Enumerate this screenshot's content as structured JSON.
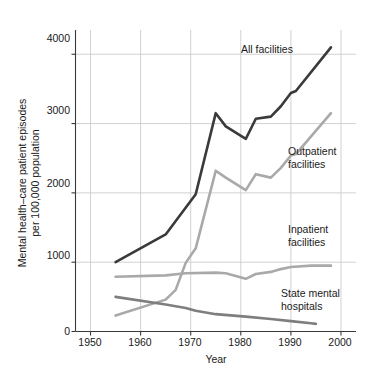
{
  "chart_data": {
    "type": "line",
    "title": "",
    "xlabel": "Year",
    "ylabel": "Mental health–care patient episodes per 100,000 population",
    "ylabel_line1": "Mental health–care patient episodes",
    "ylabel_line2": "per 100,000 population",
    "xlim": [
      1947,
      2003
    ],
    "ylim": [
      0,
      4350
    ],
    "xticks": [
      1950,
      1960,
      1970,
      1980,
      1990,
      2000
    ],
    "xtick_labels": [
      "1950",
      "1960",
      "1970",
      "1980",
      "1990",
      "2000"
    ],
    "yticks": [
      0,
      1000,
      2000,
      3000,
      4000
    ],
    "ytick_labels": [
      "0",
      "1000",
      "2000",
      "3000",
      "4000"
    ],
    "grid": "both",
    "legend": "inline-annotations",
    "series": [
      {
        "name": "All facilities",
        "color": "#3a3a3a",
        "width": 2.6,
        "label_x": 1985,
        "label_y": 3760,
        "points": [
          [
            1955,
            1000
          ],
          [
            1965,
            1400
          ],
          [
            1971,
            1980
          ],
          [
            1975,
            3150
          ],
          [
            1977,
            2960
          ],
          [
            1981,
            2780
          ],
          [
            1983,
            3070
          ],
          [
            1986,
            3100
          ],
          [
            1988,
            3250
          ],
          [
            1990,
            3440
          ],
          [
            1991,
            3470
          ],
          [
            1998,
            4100
          ]
        ]
      },
      {
        "name": "Outpatient facilities",
        "color": "#a9a9a9",
        "width": 2.6,
        "label_x": 1988,
        "label_y": 2480,
        "points": [
          [
            1955,
            230
          ],
          [
            1965,
            460
          ],
          [
            1967,
            600
          ],
          [
            1969,
            990
          ],
          [
            1971,
            1200
          ],
          [
            1975,
            2320
          ],
          [
            1977,
            2220
          ],
          [
            1981,
            2040
          ],
          [
            1983,
            2270
          ],
          [
            1986,
            2220
          ],
          [
            1988,
            2360
          ],
          [
            1990,
            2540
          ],
          [
            1991,
            2560
          ],
          [
            1998,
            3150
          ]
        ]
      },
      {
        "name": "Inpatient facilities",
        "color": "#a9a9a9",
        "width": 2.6,
        "label_x": 1988,
        "label_y": 1310,
        "points": [
          [
            1955,
            790
          ],
          [
            1965,
            810
          ],
          [
            1969,
            840
          ],
          [
            1975,
            850
          ],
          [
            1977,
            840
          ],
          [
            1981,
            760
          ],
          [
            1983,
            830
          ],
          [
            1986,
            860
          ],
          [
            1988,
            900
          ],
          [
            1990,
            930
          ],
          [
            1994,
            950
          ],
          [
            1998,
            950
          ]
        ]
      },
      {
        "name": "State mental hospitals",
        "color": "#7e7e7e",
        "width": 2.6,
        "label_x": 1985,
        "label_y": 420,
        "points": [
          [
            1955,
            500
          ],
          [
            1965,
            390
          ],
          [
            1969,
            340
          ],
          [
            1971,
            300
          ],
          [
            1975,
            250
          ],
          [
            1981,
            215
          ],
          [
            1986,
            180
          ],
          [
            1990,
            150
          ],
          [
            1994,
            120
          ],
          [
            1995,
            110
          ]
        ]
      }
    ],
    "annotations": [
      {
        "key": "all-facilities",
        "lines": [
          "All facilities"
        ]
      },
      {
        "key": "outpatient-facilities",
        "lines": [
          "Outpatient",
          "facilities"
        ]
      },
      {
        "key": "inpatient-facilities",
        "lines": [
          "Inpatient",
          "facilities"
        ]
      },
      {
        "key": "state-mental-hospitals",
        "lines": [
          "State mental",
          "hospitals"
        ]
      }
    ]
  },
  "axes": {
    "x_tick_0": "1950",
    "x_tick_1": "1960",
    "x_tick_2": "1970",
    "x_tick_3": "1980",
    "x_tick_4": "1990",
    "x_tick_5": "2000",
    "y_tick_0": "0",
    "y_tick_1": "1000",
    "y_tick_2": "2000",
    "y_tick_3": "3000",
    "y_tick_4": "4000",
    "x_axis_title": "Year",
    "y_axis_title_line1": "Mental health–care patient episodes",
    "y_axis_title_line2": "per 100,000 population"
  },
  "annotations": {
    "all_facilities": "All facilities",
    "outpatient_line1": "Outpatient",
    "outpatient_line2": "facilities",
    "inpatient_line1": "Inpatient",
    "inpatient_line2": "facilities",
    "state_line1": "State mental",
    "state_line2": "hospitals"
  }
}
